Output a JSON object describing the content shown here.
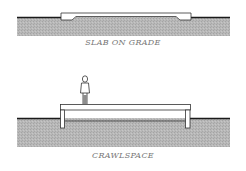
{
  "figure": {
    "panels": [
      {
        "id": "slab",
        "caption": "SLAB ON GRADE"
      },
      {
        "id": "crawl",
        "caption": "CRAWLSPACE"
      }
    ],
    "colors": {
      "ground_fill": "#b5b5b5",
      "ground_line": "#1a1a1a",
      "outline": "#333333",
      "caption": "#777777"
    }
  }
}
